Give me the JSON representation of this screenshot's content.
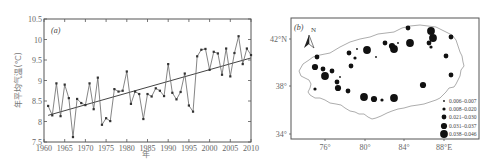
{
  "chart_data": [
    {
      "type": "line",
      "panel_label": "(a)",
      "title": "",
      "xlabel": "年",
      "ylabel": "年平均气温(℃)",
      "xlim": [
        1960,
        2010
      ],
      "ylim": [
        7.5,
        10.5
      ],
      "x_ticks": [
        1960,
        1965,
        1970,
        1975,
        1980,
        1985,
        1990,
        1995,
        2000,
        2005,
        2010
      ],
      "y_ticks": [
        7.5,
        8,
        8.5,
        9,
        9.5,
        10,
        10.5
      ],
      "y_tick_labels": [
        "7.5",
        "8",
        "8.5",
        "9",
        "9.5",
        "10",
        "10.5"
      ],
      "grid": false,
      "series": [
        {
          "name": "annual mean temperature",
          "x": [
            1961,
            1962,
            1963,
            1964,
            1965,
            1966,
            1967,
            1968,
            1969,
            1970,
            1971,
            1972,
            1973,
            1974,
            1975,
            1976,
            1977,
            1978,
            1979,
            1980,
            1981,
            1982,
            1983,
            1984,
            1985,
            1986,
            1987,
            1988,
            1989,
            1990,
            1991,
            1992,
            1993,
            1994,
            1995,
            1996,
            1997,
            1998,
            1999,
            2000,
            2001,
            2002,
            2003,
            2004,
            2005,
            2006,
            2007,
            2008,
            2009,
            2010
          ],
          "values": [
            8.38,
            8.15,
            8.93,
            8.13,
            8.9,
            8.57,
            7.62,
            8.55,
            8.45,
            8.4,
            8.93,
            8.3,
            9.07,
            7.92,
            8.08,
            8.01,
            8.79,
            8.73,
            8.75,
            9.22,
            8.43,
            8.73,
            8.67,
            8.06,
            8.67,
            8.61,
            8.81,
            8.75,
            8.62,
            9.4,
            8.7,
            8.54,
            8.72,
            9.17,
            8.39,
            8.24,
            9.59,
            9.75,
            9.77,
            9.26,
            9.7,
            9.66,
            9.14,
            9.78,
            9.1,
            9.67,
            10.08,
            9.4,
            9.78,
            9.62
          ]
        },
        {
          "name": "linear trend",
          "x": [
            1961,
            2010
          ],
          "values": [
            8.15,
            9.55
          ]
        }
      ]
    },
    {
      "type": "scatter",
      "panel_label": "(b)",
      "title": "",
      "north_arrow_label": "N",
      "x_ticks": [
        "76°",
        "80°",
        "84°",
        "88°E"
      ],
      "y_ticks": [
        "34°",
        "38°",
        "42°N"
      ],
      "legend": {
        "position": "bottom-right",
        "entries": [
          {
            "label": "0.006–0.007",
            "size": 1
          },
          {
            "label": "0.008–0.020",
            "size": 2
          },
          {
            "label": "0.021–0.030",
            "size": 3
          },
          {
            "label": "0.031–0.037",
            "size": 4
          },
          {
            "label": "0.038–0.046",
            "size": 5
          }
        ]
      },
      "points": [
        {
          "x": 408,
          "y": 28,
          "size": 3
        },
        {
          "x": 431,
          "y": 31,
          "size": 5
        },
        {
          "x": 433,
          "y": 38,
          "size": 5
        },
        {
          "x": 429,
          "y": 43,
          "size": 3
        },
        {
          "x": 431,
          "y": 47,
          "size": 2
        },
        {
          "x": 451,
          "y": 37,
          "size": 3
        },
        {
          "x": 385,
          "y": 43,
          "size": 3
        },
        {
          "x": 392,
          "y": 46,
          "size": 4
        },
        {
          "x": 394,
          "y": 49,
          "size": 5
        },
        {
          "x": 398,
          "y": 43,
          "size": 1
        },
        {
          "x": 410,
          "y": 43,
          "size": 5
        },
        {
          "x": 367,
          "y": 50,
          "size": 5
        },
        {
          "x": 357,
          "y": 49,
          "size": 1
        },
        {
          "x": 349,
          "y": 53,
          "size": 3
        },
        {
          "x": 355,
          "y": 58,
          "size": 2
        },
        {
          "x": 376,
          "y": 57,
          "size": 1
        },
        {
          "x": 317,
          "y": 57,
          "size": 3
        },
        {
          "x": 315,
          "y": 67,
          "size": 4
        },
        {
          "x": 323,
          "y": 69,
          "size": 3
        },
        {
          "x": 325,
          "y": 76,
          "size": 5
        },
        {
          "x": 332,
          "y": 71,
          "size": 3
        },
        {
          "x": 351,
          "y": 66,
          "size": 3
        },
        {
          "x": 340,
          "y": 77,
          "size": 1
        },
        {
          "x": 337,
          "y": 82,
          "size": 3
        },
        {
          "x": 338,
          "y": 88,
          "size": 4
        },
        {
          "x": 315,
          "y": 89,
          "size": 2
        },
        {
          "x": 348,
          "y": 91,
          "size": 3
        },
        {
          "x": 364,
          "y": 97,
          "size": 5
        },
        {
          "x": 374,
          "y": 99,
          "size": 4
        },
        {
          "x": 382,
          "y": 100,
          "size": 2
        },
        {
          "x": 394,
          "y": 98,
          "size": 5
        },
        {
          "x": 423,
          "y": 85,
          "size": 4
        },
        {
          "x": 446,
          "y": 56,
          "size": 3
        },
        {
          "x": 451,
          "y": 75,
          "size": 3
        }
      ]
    }
  ],
  "colors": {
    "line": "#555555",
    "axis": "#555555",
    "dots": "#111111",
    "outline": "#8a8a8a"
  }
}
